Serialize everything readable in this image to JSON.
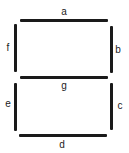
{
  "diagram": {
    "segments": [
      {
        "id": "a",
        "label": "a",
        "orientation": "horizontal",
        "position": "top"
      },
      {
        "id": "b",
        "label": "b",
        "orientation": "vertical",
        "position": "upper-right"
      },
      {
        "id": "c",
        "label": "c",
        "orientation": "vertical",
        "position": "lower-right"
      },
      {
        "id": "d",
        "label": "d",
        "orientation": "horizontal",
        "position": "bottom"
      },
      {
        "id": "e",
        "label": "e",
        "orientation": "vertical",
        "position": "lower-left"
      },
      {
        "id": "f",
        "label": "f",
        "orientation": "vertical",
        "position": "upper-left"
      },
      {
        "id": "g",
        "label": "g",
        "orientation": "horizontal",
        "position": "middle"
      }
    ],
    "colors": {
      "segment": "#1a1a1a",
      "background": "#ffffff"
    }
  }
}
